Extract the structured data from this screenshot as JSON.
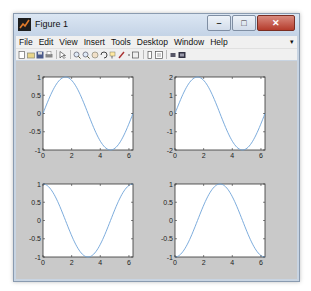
{
  "window": {
    "title": "Figure 1",
    "buttons": {
      "minimize": "–",
      "maximize": "□",
      "close": "✕"
    }
  },
  "menubar": {
    "items": [
      "File",
      "Edit",
      "View",
      "Insert",
      "Tools",
      "Desktop",
      "Window",
      "Help"
    ],
    "overflow": "▾"
  },
  "toolbar": {
    "icons": [
      "new-figure-icon",
      "open-file-icon",
      "save-icon",
      "print-icon",
      "edit-plot-icon",
      "zoom-in-icon",
      "zoom-out-icon",
      "pan-icon",
      "rotate-3d-icon",
      "data-cursor-icon",
      "brush-icon",
      "brush-dropdown-icon",
      "link-plot-icon",
      "colorbar-icon",
      "legend-icon",
      "hide-plot-tools-icon",
      "show-plot-tools-icon"
    ]
  },
  "colors": {
    "line": "#6ea3d8",
    "canvas": "#c9c9c9",
    "axes_bg": "#ffffff"
  },
  "chart_data": [
    {
      "type": "line",
      "title": "",
      "function": "sin(x)",
      "xlim": [
        0,
        6.2832
      ],
      "ylim": [
        -1,
        1
      ],
      "xticks": [
        "0",
        "2",
        "4",
        "6"
      ],
      "yticks": [
        "-1",
        "-0.5",
        "0",
        "0.5",
        "1"
      ],
      "series": [
        {
          "name": "sin(x)",
          "x": [
            0,
            0.785,
            1.571,
            2.356,
            3.142,
            3.927,
            4.712,
            5.498,
            6.283
          ],
          "values": [
            0,
            0.707,
            1,
            0.707,
            0,
            -0.707,
            -1,
            -0.707,
            0
          ]
        }
      ]
    },
    {
      "type": "line",
      "title": "",
      "function": "2*sin(x)",
      "xlim": [
        0,
        6.2832
      ],
      "ylim": [
        -2,
        2
      ],
      "xticks": [
        "0",
        "2",
        "4",
        "6"
      ],
      "yticks": [
        "-2",
        "-1",
        "0",
        "1",
        "2"
      ],
      "series": [
        {
          "name": "2sin(x)",
          "x": [
            0,
            0.785,
            1.571,
            2.356,
            3.142,
            3.927,
            4.712,
            5.498,
            6.283
          ],
          "values": [
            0,
            1.414,
            2,
            1.414,
            0,
            -1.414,
            -2,
            -1.414,
            0
          ]
        }
      ]
    },
    {
      "type": "line",
      "title": "",
      "function": "cos(x)",
      "xlim": [
        0,
        6.2832
      ],
      "ylim": [
        -1,
        1
      ],
      "xticks": [
        "0",
        "2",
        "4",
        "6"
      ],
      "yticks": [
        "-1",
        "-0.5",
        "0",
        "0.5",
        "1"
      ],
      "series": [
        {
          "name": "cos(x)",
          "x": [
            0,
            0.785,
            1.571,
            2.356,
            3.142,
            3.927,
            4.712,
            5.498,
            6.283
          ],
          "values": [
            1,
            0.707,
            0,
            -0.707,
            -1,
            -0.707,
            0,
            0.707,
            1
          ]
        }
      ]
    },
    {
      "type": "line",
      "title": "",
      "function": "-cos(x)",
      "xlim": [
        0,
        6.2832
      ],
      "ylim": [
        -1,
        1
      ],
      "xticks": [
        "0",
        "2",
        "4",
        "6"
      ],
      "yticks": [
        "-1",
        "-0.5",
        "0",
        "0.5",
        "1"
      ],
      "series": [
        {
          "name": "-cos(x)",
          "x": [
            0,
            0.785,
            1.571,
            2.356,
            3.142,
            3.927,
            4.712,
            5.498,
            6.283
          ],
          "values": [
            -1,
            -0.707,
            0,
            0.707,
            1,
            0.707,
            0,
            -0.707,
            -1
          ]
        }
      ]
    }
  ]
}
